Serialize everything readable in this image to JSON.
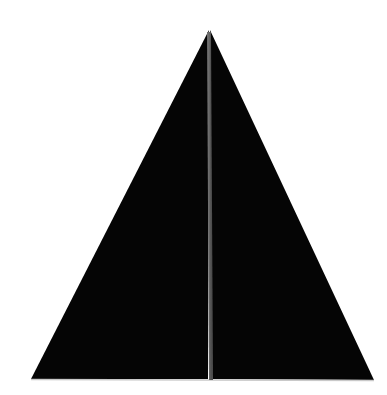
{
  "canvas": {
    "width": 387,
    "height": 395,
    "background_color": "#ffffff",
    "title": "Black triangle split by a vertical gray seam"
  },
  "figure": {
    "name": "split-triangle",
    "kind": "geometric-shape",
    "description": "A solid black isosceles triangle standing on its base, divided down the middle by a thin vertical gray line into two equal halves.",
    "fill_color": "#050505",
    "apex": {
      "x": 209,
      "y": 30
    },
    "bottom_left": {
      "x": 31,
      "y": 379
    },
    "bottom_right": {
      "x": 374,
      "y": 380
    },
    "left_half": {
      "label": "left-half",
      "points": "209,30 31,379 208,379"
    },
    "right_half": {
      "label": "right-half",
      "points": "210,30 212,379 374,380"
    }
  },
  "seam": {
    "name": "center-divider",
    "color": "#5a5a5a",
    "highlight_color": "#787878",
    "width_px": 4,
    "top": {
      "x": 209,
      "y": 32
    },
    "bottom": {
      "x": 211,
      "y": 380
    }
  },
  "base_edge": {
    "name": "base-highlight-line",
    "color": "#c9c9c9",
    "thickness_px": 1.5,
    "from": {
      "x": 31,
      "y": 379.5
    },
    "to": {
      "x": 374,
      "y": 380.5
    }
  }
}
